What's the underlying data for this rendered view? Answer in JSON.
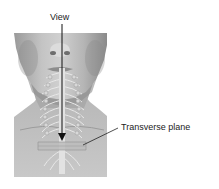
{
  "diagram": {
    "labels": {
      "view": "View",
      "transverse_plane": "Transverse plane"
    },
    "colors": {
      "background": "#ffffff",
      "skin_light": "#cfcfcf",
      "skin_mid": "#a9a9a9",
      "skin_dark": "#7d7d7d",
      "nerve": "#e6e6e6",
      "arrow": "#111111",
      "label_text": "#222222"
    }
  }
}
